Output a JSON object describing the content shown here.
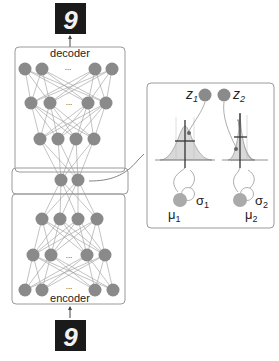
{
  "diagram": {
    "decoder_label": "decoder",
    "encoder_label": "encoder",
    "ellipsis": "...",
    "output_image_digit": "9",
    "input_image_digit": "9",
    "latent": {
      "z1": "z",
      "z1_sub": "1",
      "z2": "z",
      "z2_sub": "2",
      "mu1": "μ",
      "mu1_sub": "1",
      "mu2": "μ",
      "mu2_sub": "2",
      "sigma1": "σ",
      "sigma1_sub": "1",
      "sigma2": "σ",
      "sigma2_sub": "2"
    },
    "colors": {
      "node": "#8a8a8a",
      "edge": "#9a9a9a",
      "box_border": "#9a9a9a",
      "image_bg": "#1a1a1a",
      "gaussian_fill": "#d9d9d9"
    }
  }
}
